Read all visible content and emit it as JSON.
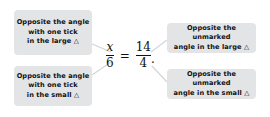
{
  "annotations": {
    "top_left": {
      "lines": [
        "Opposite the angle",
        "with one tick",
        "in the large △"
      ]
    },
    "bottom_left": {
      "lines": [
        "Opposite the angle",
        "with one tick",
        "in the small △"
      ]
    },
    "top_right": {
      "lines": [
        "Opposite the unmarked",
        "angle in the large △"
      ]
    },
    "bottom_right": {
      "lines": [
        "Opposite the unmarked",
        "angle in the small △"
      ]
    }
  },
  "equation": {
    "left": {
      "numerator": "x",
      "denominator": "6"
    },
    "operator": "=",
    "right": {
      "numerator": "14",
      "denominator": "4"
    },
    "terminator": "."
  },
  "colors": {
    "box_fill": "#e3e4e6",
    "connector": "#d4d5d8",
    "text": "#111111"
  }
}
